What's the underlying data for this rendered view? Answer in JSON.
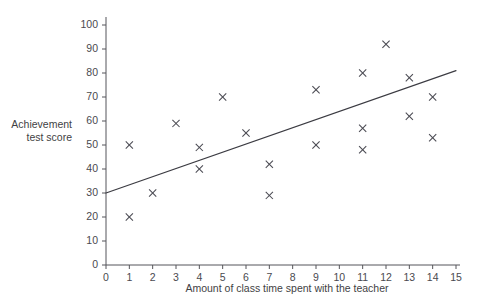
{
  "chart_data": {
    "type": "scatter",
    "title": "",
    "xlabel": "Amount of class time spent with the teacher",
    "ylabel": "Achievement test score",
    "ylabel_lines": [
      "Achievement",
      "test score"
    ],
    "xlim": [
      0,
      15
    ],
    "ylim": [
      0,
      100
    ],
    "xticks": [
      0,
      1,
      2,
      3,
      4,
      5,
      6,
      7,
      8,
      9,
      10,
      11,
      12,
      13,
      14,
      15
    ],
    "yticks": [
      0,
      10,
      20,
      30,
      40,
      50,
      60,
      70,
      80,
      90,
      100
    ],
    "xtick_labels": [
      "0",
      "1",
      "2",
      "3",
      "4",
      "5",
      "6",
      "7",
      "8",
      "9",
      "10",
      "11",
      "12",
      "13",
      "14",
      "15"
    ],
    "ytick_labels": [
      "0",
      "10",
      "20",
      "30",
      "40",
      "50",
      "60",
      "70",
      "80",
      "90",
      "100"
    ],
    "grid": false,
    "legend": null,
    "marker": "x",
    "marker_color": "#4a4a52",
    "points": [
      {
        "x": 1,
        "y": 50
      },
      {
        "x": 1,
        "y": 20
      },
      {
        "x": 2,
        "y": 30
      },
      {
        "x": 3,
        "y": 59
      },
      {
        "x": 4,
        "y": 49
      },
      {
        "x": 4,
        "y": 40
      },
      {
        "x": 5,
        "y": 70
      },
      {
        "x": 6,
        "y": 55
      },
      {
        "x": 7,
        "y": 42
      },
      {
        "x": 7,
        "y": 29
      },
      {
        "x": 9,
        "y": 73
      },
      {
        "x": 9,
        "y": 50
      },
      {
        "x": 11,
        "y": 80
      },
      {
        "x": 11,
        "y": 57
      },
      {
        "x": 11,
        "y": 48
      },
      {
        "x": 12,
        "y": 92
      },
      {
        "x": 13,
        "y": 78
      },
      {
        "x": 13,
        "y": 62
      },
      {
        "x": 14,
        "y": 70
      },
      {
        "x": 14,
        "y": 53
      }
    ],
    "trend_line": {
      "x0": 0,
      "y0": 30,
      "x1": 15,
      "y1": 81,
      "color": "#3b3b42"
    }
  }
}
